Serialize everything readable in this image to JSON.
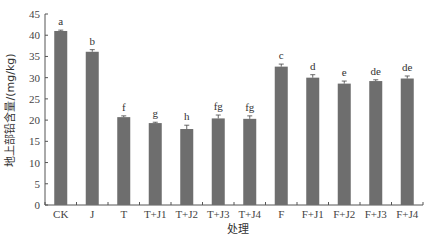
{
  "chart_data": {
    "type": "bar",
    "title": "",
    "xlabel": "处理",
    "ylabel": "地上部铅含量/(mg/kg)",
    "ylim": [
      0,
      45
    ],
    "yticks": [
      0,
      5,
      10,
      15,
      20,
      25,
      30,
      35,
      40,
      45
    ],
    "grid": false,
    "legend": null,
    "categories": [
      "CK",
      "J",
      "T",
      "T+J1",
      "T+J2",
      "T+J3",
      "T+J4",
      "F",
      "F+J1",
      "F+J2",
      "F+J3",
      "F+J4"
    ],
    "values": [
      41.0,
      36.1,
      20.7,
      19.3,
      17.9,
      20.4,
      20.3,
      32.6,
      30.0,
      28.6,
      29.2,
      29.8
    ],
    "errors": [
      0.2,
      0.5,
      0.3,
      0.2,
      0.9,
      0.8,
      0.7,
      0.6,
      0.7,
      0.6,
      0.3,
      0.6
    ],
    "significance_letters": [
      "a",
      "b",
      "f",
      "g",
      "h",
      "fg",
      "fg",
      "c",
      "d",
      "e",
      "de",
      "de"
    ],
    "bar_color": "#6e6e6e"
  }
}
